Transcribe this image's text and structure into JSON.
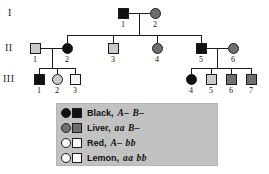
{
  "figure": {
    "type": "pedigree-chart",
    "generation_labels": [
      "I",
      "II",
      "III"
    ],
    "trait_name": "coat color in dogs"
  },
  "individuals": [
    {
      "id": "I-1",
      "generation": "I",
      "number": "1",
      "sex": "male",
      "shape": "square",
      "phenotype": "Black",
      "fill": "black",
      "color": "#111111",
      "x": 118,
      "y": 8,
      "label_x": 117,
      "label_y": 20
    },
    {
      "id": "I-2",
      "generation": "I",
      "number": "2",
      "sex": "female",
      "shape": "circle",
      "phenotype": "Liver",
      "fill": "liver",
      "color": "#6f6f6f",
      "x": 150,
      "y": 8,
      "label_x": 149,
      "label_y": 20
    },
    {
      "id": "II-1",
      "generation": "II",
      "number": "1",
      "sex": "male",
      "shape": "square",
      "phenotype": "Red",
      "fill": "red",
      "color": "#c9c9c9",
      "x": 30,
      "y": 43,
      "label_x": 29,
      "label_y": 55
    },
    {
      "id": "II-2",
      "generation": "II",
      "number": "2",
      "sex": "female",
      "shape": "circle",
      "phenotype": "Black",
      "fill": "black",
      "color": "#111111",
      "x": 62,
      "y": 43,
      "label_x": 61,
      "label_y": 55
    },
    {
      "id": "II-3",
      "generation": "II",
      "number": "3",
      "sex": "male",
      "shape": "square",
      "phenotype": "Red",
      "fill": "red",
      "color": "#c9c9c9",
      "x": 108,
      "y": 43,
      "label_x": 107,
      "label_y": 55
    },
    {
      "id": "II-4",
      "generation": "II",
      "number": "4",
      "sex": "female",
      "shape": "circle",
      "phenotype": "Liver",
      "fill": "liver",
      "color": "#6f6f6f",
      "x": 152,
      "y": 43,
      "label_x": 151,
      "label_y": 55
    },
    {
      "id": "II-5",
      "generation": "II",
      "number": "5",
      "sex": "male",
      "shape": "square",
      "phenotype": "Black",
      "fill": "black",
      "color": "#111111",
      "x": 196,
      "y": 43,
      "label_x": 195,
      "label_y": 55
    },
    {
      "id": "II-6",
      "generation": "II",
      "number": "6",
      "sex": "female",
      "shape": "circle",
      "phenotype": "Liver",
      "fill": "liver",
      "color": "#6f6f6f",
      "x": 228,
      "y": 43,
      "label_x": 227,
      "label_y": 55
    },
    {
      "id": "III-1",
      "generation": "III",
      "number": "1",
      "sex": "male",
      "shape": "square",
      "phenotype": "Black",
      "fill": "black",
      "color": "#111111",
      "x": 34,
      "y": 74,
      "label_x": 33,
      "label_y": 86
    },
    {
      "id": "III-2",
      "generation": "III",
      "number": "2",
      "sex": "female",
      "shape": "circle",
      "phenotype": "Red",
      "fill": "red",
      "color": "#c9c9c9",
      "x": 52,
      "y": 74,
      "label_x": 51,
      "label_y": 86
    },
    {
      "id": "III-3",
      "generation": "III",
      "number": "3",
      "sex": "male",
      "shape": "square",
      "phenotype": "Lemon",
      "fill": "lemon",
      "color": "#f4f4f4",
      "x": 70,
      "y": 74,
      "label_x": 69,
      "label_y": 86
    },
    {
      "id": "III-4",
      "generation": "III",
      "number": "4",
      "sex": "female",
      "shape": "circle",
      "phenotype": "Black",
      "fill": "black",
      "color": "#111111",
      "x": 186,
      "y": 74,
      "label_x": 185,
      "label_y": 86
    },
    {
      "id": "III-5",
      "generation": "III",
      "number": "5",
      "sex": "male",
      "shape": "square",
      "phenotype": "Red",
      "fill": "red",
      "color": "#c9c9c9",
      "x": 206,
      "y": 74,
      "label_x": 205,
      "label_y": 86
    },
    {
      "id": "III-6",
      "generation": "III",
      "number": "6",
      "sex": "male",
      "shape": "square",
      "phenotype": "Liver",
      "fill": "liver",
      "color": "#6f6f6f",
      "x": 226,
      "y": 74,
      "label_x": 225,
      "label_y": 86
    },
    {
      "id": "III-7",
      "generation": "III",
      "number": "7",
      "sex": "male",
      "shape": "square",
      "phenotype": "Liver",
      "fill": "liver",
      "color": "#6f6f6f",
      "x": 246,
      "y": 74,
      "label_x": 245,
      "label_y": 86
    }
  ],
  "legend": {
    "background": "#c2c2c2",
    "entries": [
      {
        "phenotype": "Black,",
        "genotype": "A–  B–",
        "fill": "black",
        "color": "#111111"
      },
      {
        "phenotype": "Liver,",
        "genotype": "aa  B–",
        "fill": "liver",
        "color": "#6f6f6f"
      },
      {
        "phenotype": "Red,",
        "genotype": "A–  bb",
        "fill": "red",
        "color": "#f6f6f6"
      },
      {
        "phenotype": "Lemon,",
        "genotype": "aa  bb",
        "fill": "lemon",
        "color": "#fbfbfb"
      }
    ]
  }
}
